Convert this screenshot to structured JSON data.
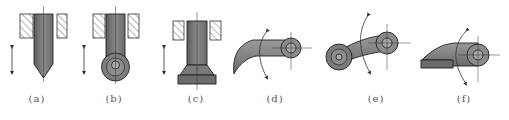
{
  "diagram": {
    "colors": {
      "body": "#7a7a7a",
      "body_dark": "#5a5a5a",
      "outline": "#2a2a2a",
      "hatch": "#444444",
      "label": "#555555"
    },
    "figures": [
      {
        "id": "a",
        "label": "(a)",
        "shape": "pointed translating follower"
      },
      {
        "id": "b",
        "label": "(b)",
        "shape": "roller translating follower"
      },
      {
        "id": "c",
        "label": "(c)",
        "shape": "flat-faced translating follower"
      },
      {
        "id": "d",
        "label": "(d)",
        "shape": "pointed oscillating follower"
      },
      {
        "id": "e",
        "label": "(e)",
        "shape": "roller oscillating follower"
      },
      {
        "id": "f",
        "label": "(f)",
        "shape": "flat-faced oscillating follower"
      }
    ]
  }
}
